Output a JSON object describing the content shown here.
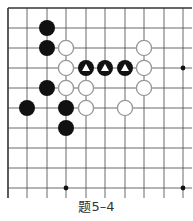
{
  "diagram": {
    "type": "go-problem",
    "caption": "题5–4",
    "grid": {
      "columns_x": [
        8,
        27,
        47,
        66,
        86,
        105,
        125,
        144,
        164,
        183
      ],
      "rows_y": [
        8,
        28,
        48,
        68,
        88,
        108,
        128,
        148,
        168,
        188
      ],
      "closed_edges": [
        "top",
        "left"
      ],
      "open_edges": [
        "right",
        "bottom"
      ],
      "line_color": "#444444",
      "border_color": "#333333"
    },
    "star_points": [
      {
        "col": 9,
        "row": 3
      },
      {
        "col": 3,
        "row": 9
      },
      {
        "col": 9,
        "row": 9
      }
    ],
    "stones": [
      {
        "color": "black",
        "col": 2,
        "row": 1,
        "marker": ""
      },
      {
        "color": "black",
        "col": 2,
        "row": 2,
        "marker": ""
      },
      {
        "color": "white",
        "col": 3,
        "row": 2,
        "marker": ""
      },
      {
        "color": "white",
        "col": 7,
        "row": 2,
        "marker": ""
      },
      {
        "color": "white",
        "col": 3,
        "row": 3,
        "marker": ""
      },
      {
        "color": "black",
        "col": 4,
        "row": 3,
        "marker": "triangle"
      },
      {
        "color": "black",
        "col": 5,
        "row": 3,
        "marker": "triangle"
      },
      {
        "color": "black",
        "col": 6,
        "row": 3,
        "marker": "triangle"
      },
      {
        "color": "white",
        "col": 7,
        "row": 3,
        "marker": ""
      },
      {
        "color": "black",
        "col": 2,
        "row": 4,
        "marker": ""
      },
      {
        "color": "white",
        "col": 3,
        "row": 4,
        "marker": ""
      },
      {
        "color": "white",
        "col": 4,
        "row": 4,
        "marker": ""
      },
      {
        "color": "white",
        "col": 7,
        "row": 4,
        "marker": ""
      },
      {
        "color": "black",
        "col": 1,
        "row": 5,
        "marker": ""
      },
      {
        "color": "black",
        "col": 3,
        "row": 5,
        "marker": ""
      },
      {
        "color": "white",
        "col": 4,
        "row": 5,
        "marker": ""
      },
      {
        "color": "white",
        "col": 6,
        "row": 5,
        "marker": ""
      },
      {
        "color": "black",
        "col": 3,
        "row": 6,
        "marker": ""
      }
    ],
    "colors": {
      "black_stone": "#111111",
      "white_stone_fill": "#ffffff",
      "white_stone_stroke": "#999999",
      "triangle_marker": "#ffffff"
    }
  }
}
